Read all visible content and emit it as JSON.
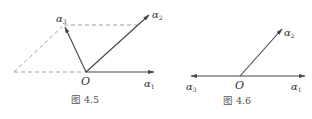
{
  "figures": [
    {
      "caption": "图 4.5",
      "origin_label": "O",
      "vectors": [
        {
          "symbol": "α",
          "sub": "1"
        },
        {
          "symbol": "α",
          "sub": "2"
        },
        {
          "symbol": "α",
          "sub": "3"
        }
      ]
    },
    {
      "caption": "图 4.6",
      "origin_label": "O",
      "vectors": [
        {
          "symbol": "α",
          "sub": "1"
        },
        {
          "symbol": "α",
          "sub": "2"
        },
        {
          "symbol": "α",
          "sub": "3"
        }
      ]
    }
  ],
  "colors": {
    "line": "#444444",
    "dashed": "#888888",
    "text": "#333333"
  }
}
